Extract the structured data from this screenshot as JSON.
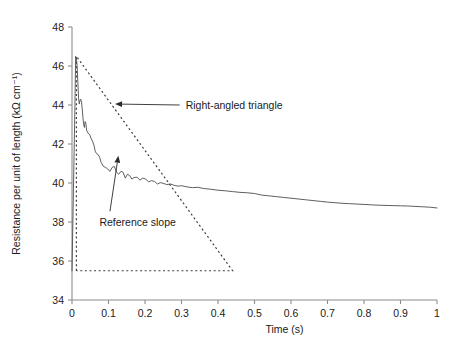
{
  "chart_data": {
    "type": "line",
    "title": "",
    "xlabel": "Time (s)",
    "ylabel": "Resistance per unit of length (kΩ cm⁻¹)",
    "xlim": [
      0,
      1
    ],
    "ylim": [
      34,
      48
    ],
    "xticks": [
      0,
      0.1,
      0.2,
      0.3,
      0.4,
      0.5,
      0.6,
      0.7,
      0.8,
      0.9,
      1
    ],
    "xticklabels": [
      "0",
      "0.1",
      "0.2",
      "0.3",
      "0.4",
      "0.5",
      "0.6",
      "0.7",
      "0.8",
      "0.9",
      "1"
    ],
    "yticks": [
      34,
      36,
      38,
      40,
      42,
      44,
      46,
      48
    ],
    "yticklabels": [
      "34",
      "36",
      "38",
      "40",
      "42",
      "44",
      "46",
      "48"
    ],
    "grid": false,
    "legend": null,
    "series": [
      {
        "name": "Resistance per unit of length",
        "style": "solid",
        "color": "#4d4d4d",
        "x": [
          0.0,
          0.004,
          0.008,
          0.01,
          0.012,
          0.014,
          0.016,
          0.018,
          0.02,
          0.022,
          0.024,
          0.026,
          0.028,
          0.03,
          0.032,
          0.034,
          0.036,
          0.038,
          0.04,
          0.044,
          0.048,
          0.052,
          0.056,
          0.06,
          0.064,
          0.068,
          0.072,
          0.076,
          0.08,
          0.086,
          0.092,
          0.098,
          0.104,
          0.11,
          0.116,
          0.122,
          0.128,
          0.134,
          0.14,
          0.146,
          0.152,
          0.158,
          0.164,
          0.17,
          0.178,
          0.186,
          0.194,
          0.202,
          0.21,
          0.218,
          0.226,
          0.234,
          0.242,
          0.25,
          0.26,
          0.27,
          0.28,
          0.29,
          0.3,
          0.315,
          0.33,
          0.345,
          0.36,
          0.38,
          0.4,
          0.42,
          0.44,
          0.46,
          0.48,
          0.5,
          0.52,
          0.54,
          0.56,
          0.58,
          0.6,
          0.62,
          0.64,
          0.66,
          0.68,
          0.7,
          0.72,
          0.74,
          0.76,
          0.78,
          0.8,
          0.82,
          0.84,
          0.86,
          0.88,
          0.9,
          0.92,
          0.94,
          0.96,
          0.98,
          1.0
        ],
        "y": [
          35.5,
          39.7,
          43.9,
          46.5,
          46.4,
          46.0,
          45.2,
          44.35,
          44.05,
          44.25,
          44.3,
          44.15,
          43.8,
          43.35,
          43.0,
          42.85,
          43.15,
          43.05,
          42.7,
          42.55,
          42.5,
          42.3,
          42.15,
          41.95,
          41.6,
          41.5,
          41.45,
          41.3,
          41.05,
          40.85,
          40.8,
          40.72,
          40.6,
          40.8,
          40.85,
          40.55,
          40.45,
          40.6,
          40.55,
          40.25,
          40.45,
          40.38,
          40.2,
          40.28,
          40.3,
          40.15,
          40.25,
          40.2,
          40.06,
          40.12,
          40.08,
          39.95,
          40.02,
          39.98,
          39.92,
          39.95,
          39.88,
          39.84,
          39.86,
          39.8,
          39.76,
          39.78,
          39.72,
          39.68,
          39.63,
          39.6,
          39.56,
          39.52,
          39.5,
          39.46,
          39.38,
          39.34,
          39.3,
          39.26,
          39.22,
          39.18,
          39.14,
          39.1,
          39.06,
          39.02,
          38.99,
          38.96,
          38.94,
          38.92,
          38.9,
          38.88,
          38.86,
          38.85,
          38.84,
          38.83,
          38.82,
          38.8,
          38.78,
          38.76,
          38.72
        ]
      }
    ],
    "shapes": [
      {
        "name": "right-angled-triangle",
        "style": "dotted",
        "color": "#3d3d3d",
        "points": [
          [
            0.012,
            35.5
          ],
          [
            0.012,
            46.5
          ],
          [
            0.44,
            35.5
          ],
          [
            0.012,
            35.5
          ]
        ]
      }
    ],
    "annotations": [
      {
        "name": "right-angled-triangle",
        "text": "Right-angled triangle",
        "text_x": 0.295,
        "text_y": 44.0,
        "arrow_from_x": 0.295,
        "arrow_from_y": 44.0,
        "arrow_to_x": 0.118,
        "arrow_to_y": 44.05
      },
      {
        "name": "reference-slope",
        "text": "Reference slope",
        "text_x": 0.075,
        "text_y": 38.0,
        "arrow_from_x": 0.104,
        "arrow_from_y": 38.55,
        "arrow_to_x": 0.127,
        "arrow_to_y": 41.4
      }
    ]
  }
}
